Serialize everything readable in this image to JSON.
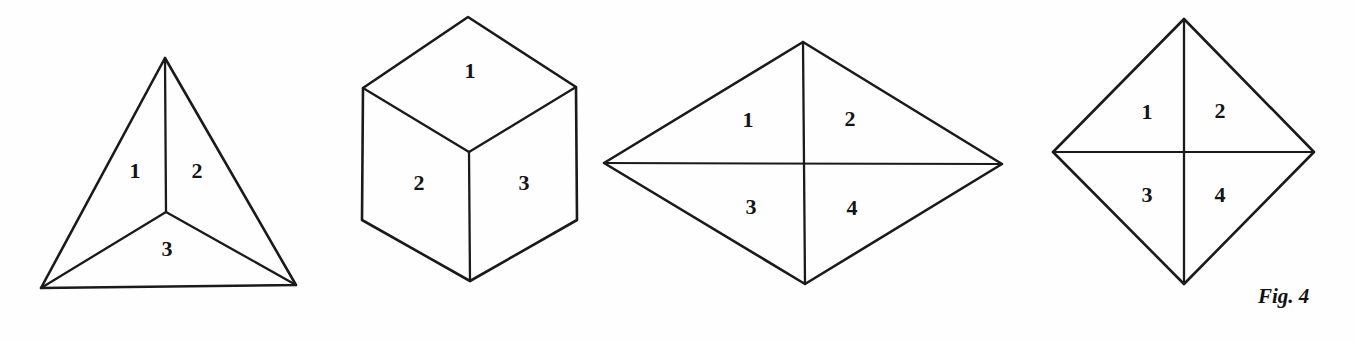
{
  "page": {
    "background_color": "#fefefe",
    "ink_color": "#1a1a1a",
    "caption": "Fig. 4",
    "width": 1355,
    "height": 341
  },
  "figures": [
    {
      "id": "tetrahedron",
      "name": "tetrahedron-figure",
      "description": "Triangle divided into three faces by lines from centre",
      "face_count": 3,
      "labels": [
        {
          "text": "1",
          "x": 135,
          "y": 173
        },
        {
          "text": "2",
          "x": 197,
          "y": 173
        },
        {
          "text": "3",
          "x": 167,
          "y": 251
        }
      ],
      "vertices": {
        "apex": [
          165,
          58
        ],
        "bottom_left": [
          41,
          288
        ],
        "bottom_right": [
          296,
          285
        ],
        "center": [
          166,
          212
        ]
      }
    },
    {
      "id": "cube",
      "name": "cube-figure",
      "description": "Isometric cube showing three faces",
      "face_count": 3,
      "labels": [
        {
          "text": "1",
          "x": 470,
          "y": 73
        },
        {
          "text": "2",
          "x": 419,
          "y": 185
        },
        {
          "text": "3",
          "x": 524,
          "y": 185
        }
      ],
      "vertices": {
        "top": [
          468,
          17
        ],
        "left_top": [
          363,
          88
        ],
        "right_top": [
          576,
          87
        ],
        "center": [
          469,
          152
        ],
        "left_bottom": [
          362,
          220
        ],
        "right_bottom": [
          577,
          220
        ],
        "bottom": [
          470,
          281
        ]
      }
    },
    {
      "id": "wide-rhombus",
      "name": "wide-rhombus-figure",
      "description": "Wide rhombus divided into four triangular faces by both diagonals",
      "face_count": 4,
      "labels": [
        {
          "text": "1",
          "x": 748,
          "y": 122
        },
        {
          "text": "2",
          "x": 850,
          "y": 121
        },
        {
          "text": "3",
          "x": 751,
          "y": 209
        },
        {
          "text": "4",
          "x": 852,
          "y": 210
        }
      ],
      "vertices": {
        "top": [
          803,
          42
        ],
        "left": [
          604,
          163
        ],
        "right": [
          1002,
          164
        ],
        "bottom": [
          805,
          284
        ]
      }
    },
    {
      "id": "square-diamond",
      "name": "square-diamond-figure",
      "description": "Square standing on a corner divided into four triangular faces by both diagonals",
      "face_count": 4,
      "labels": [
        {
          "text": "1",
          "x": 1147,
          "y": 114
        },
        {
          "text": "2",
          "x": 1220,
          "y": 113
        },
        {
          "text": "3",
          "x": 1147,
          "y": 197
        },
        {
          "text": "4",
          "x": 1220,
          "y": 197
        }
      ],
      "vertices": {
        "top": [
          1184,
          19
        ],
        "left": [
          1053,
          152
        ],
        "right": [
          1314,
          152
        ],
        "bottom": [
          1184,
          284
        ]
      }
    }
  ],
  "caption_position": {
    "x": 1258,
    "y": 303
  }
}
